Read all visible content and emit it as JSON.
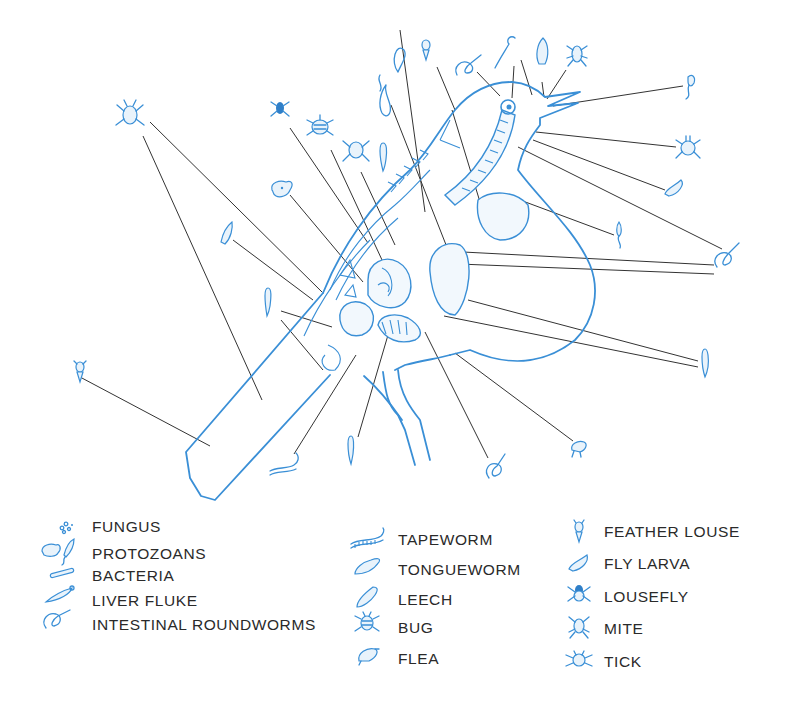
{
  "diagram": {
    "colors": {
      "illustration": "#3a8fd6",
      "leader_lines": "#333333",
      "legend_text": "#2a2a2a",
      "background": "#ffffff"
    }
  },
  "legend": {
    "columns": [
      {
        "items": [
          {
            "icon": "fungus-icon",
            "label": "FUNGUS"
          },
          {
            "icon": "protozoan-icon",
            "label": "PROTOZOANS"
          },
          {
            "icon": "bacteria-icon",
            "label": "BACTERIA"
          },
          {
            "icon": "liver-fluke-icon",
            "label": "LIVER FLUKE"
          },
          {
            "icon": "roundworm-icon",
            "label": "INTESTINAL ROUNDWORMS"
          }
        ]
      },
      {
        "items": [
          {
            "icon": "tapeworm-icon",
            "label": "TAPEWORM"
          },
          {
            "icon": "tongueworm-icon",
            "label": "TONGUEWORM"
          },
          {
            "icon": "leech-icon",
            "label": "LEECH"
          },
          {
            "icon": "bug-icon",
            "label": "BUG"
          },
          {
            "icon": "flea-icon",
            "label": "FLEA"
          }
        ]
      },
      {
        "items": [
          {
            "icon": "feather-louse-icon",
            "label": "FEATHER LOUSE"
          },
          {
            "icon": "fly-larva-icon",
            "label": "FLY LARVA"
          },
          {
            "icon": "lousefly-icon",
            "label": "LOUSEFLY"
          },
          {
            "icon": "mite-icon",
            "label": "MITE"
          },
          {
            "icon": "tick-icon",
            "label": "TICK"
          }
        ]
      }
    ]
  }
}
